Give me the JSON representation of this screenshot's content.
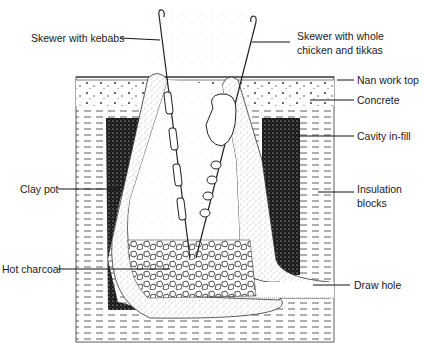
{
  "diagram": {
    "colors": {
      "ink": "#1a1a1a",
      "background": "#ffffff"
    },
    "labels": {
      "skewer_kebabs": "Skewer with kebabs",
      "skewer_chicken_line1": "Skewer with whole",
      "skewer_chicken_line2": "chicken and tikkas",
      "nan_work_top": "Nan work top",
      "concrete": "Concrete",
      "cavity_infill": "Cavity in-fill",
      "clay_pot": "Clay pot",
      "insulation_line1": "Insulation",
      "insulation_line2": "blocks",
      "hot_charcoal": "Hot charcoal",
      "draw_hole": "Draw hole"
    }
  }
}
